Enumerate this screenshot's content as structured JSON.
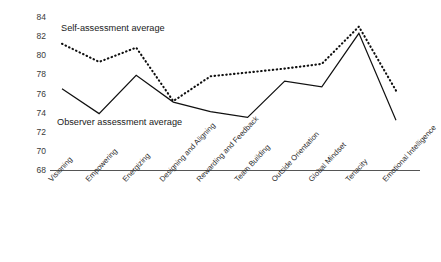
{
  "chart_data": {
    "type": "line",
    "title": "",
    "xlabel": "",
    "ylabel": "Percentile",
    "ylim": [
      68,
      84
    ],
    "yticks": [
      68,
      70,
      72,
      74,
      76,
      78,
      80,
      82,
      84
    ],
    "grid": false,
    "legend_position": "inline-annotations",
    "categories": [
      "Visioning",
      "Empowering",
      "Energizing",
      "Designing and Aligning",
      "Rewarding and Feedback",
      "Team Building",
      "Outside Orientation",
      "Global Mindset",
      "Tenacity",
      "Emotional Intelligence"
    ],
    "series": [
      {
        "name": "Self-assessment average",
        "style": "dotted",
        "values": [
          81.2,
          79.3,
          80.8,
          75.2,
          77.8,
          78.2,
          78.6,
          79.1,
          83.0,
          76.3
        ]
      },
      {
        "name": "Observer assessment average",
        "style": "solid",
        "values": [
          76.5,
          73.9,
          77.9,
          75.1,
          74.1,
          73.5,
          77.3,
          76.7,
          82.3,
          73.2
        ]
      }
    ],
    "annotations": [
      {
        "text": "Self-assessment average",
        "series": "Self-assessment average"
      },
      {
        "text": "Observer assessment average",
        "series": "Observer assessment average"
      }
    ]
  },
  "axis": {
    "y_title": "Percentile",
    "y_tick_labels": [
      "84",
      "82",
      "80",
      "78",
      "76",
      "74",
      "72",
      "70",
      "68"
    ]
  }
}
